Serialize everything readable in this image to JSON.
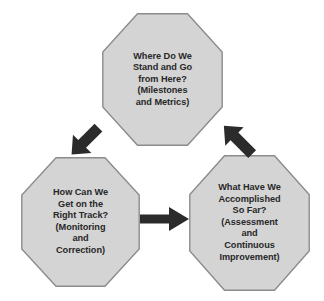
{
  "diagram": {
    "background_color": "#ffffff",
    "node_fill_color": "#d4d4d4",
    "node_border_color": "#8c8c8c",
    "text_color": "#282828",
    "arrow_color": "#2b2b2b",
    "nodes": [
      {
        "id": "node-top",
        "name": "octagon-where-do-we-stand",
        "text": "Where Do We\nStand and Go\nfrom Here?\n(Milestones\nand Metrics)"
      },
      {
        "id": "node-left",
        "name": "octagon-how-can-we-get-on-track",
        "text": "How Can We\nGet on the\nRight Track?\n(Monitoring\nand\nCorrection)"
      },
      {
        "id": "node-right",
        "name": "octagon-what-have-we-accomplished",
        "text": "What Have We\nAccomplished\nSo Far?\n(Assessment\nand\nContinuous\nImprovement)"
      }
    ],
    "arrows": [
      {
        "id": "arrow-top-to-left",
        "name": "arrow-down-left",
        "from": "node-top",
        "to": "node-left",
        "direction": "down-left"
      },
      {
        "id": "arrow-left-to-right",
        "name": "arrow-right",
        "from": "node-left",
        "to": "node-right",
        "direction": "right"
      },
      {
        "id": "arrow-right-to-top",
        "name": "arrow-up-left",
        "from": "node-right",
        "to": "node-top",
        "direction": "up-left"
      }
    ]
  }
}
